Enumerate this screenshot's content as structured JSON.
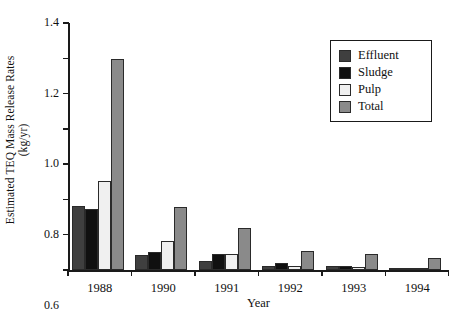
{
  "chart_data": {
    "type": "bar",
    "title": "",
    "xlabel": "Year",
    "ylabel": "Estimated TEQ Mass Release Rates",
    "ylabel_units": "(kg/yr)",
    "categories": [
      "1988",
      "1990",
      "1991",
      "1992",
      "1993",
      "1994"
    ],
    "ylim": [
      0,
      1.4
    ],
    "ytick_labels": [
      "0",
      "0.2",
      "0.4",
      "0.6",
      "0.8",
      "1.0",
      "1.2",
      "1.4"
    ],
    "ytick_values": [
      0,
      0.2,
      0.4,
      0.6,
      0.8,
      1.0,
      1.2,
      1.4
    ],
    "grid": false,
    "legend_position": "top-right",
    "series": [
      {
        "name": "Effluent",
        "color": "#3f3f3f",
        "values": [
          0.365,
          0.085,
          0.05,
          0.02,
          0.02,
          0.012
        ]
      },
      {
        "name": "Sludge",
        "color": "#101010",
        "values": [
          0.345,
          0.1,
          0.09,
          0.04,
          0.025,
          0.013
        ]
      },
      {
        "name": "Pulp",
        "color": "#f0f0f0",
        "values": [
          0.505,
          0.165,
          0.09,
          0.025,
          0.015,
          0.01
        ]
      },
      {
        "name": "Total",
        "color": "#8a8a8a",
        "values": [
          1.195,
          0.36,
          0.24,
          0.11,
          0.09,
          0.07
        ]
      }
    ]
  },
  "legend": {
    "items": [
      {
        "label": "Effluent",
        "color": "#3f3f3f"
      },
      {
        "label": "Sludge",
        "color": "#101010"
      },
      {
        "label": "Pulp",
        "color": "#f0f0f0"
      },
      {
        "label": "Total",
        "color": "#8a8a8a"
      }
    ]
  }
}
